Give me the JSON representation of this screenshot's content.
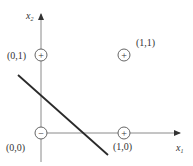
{
  "diagram": {
    "type": "linear-decision-boundary",
    "axes": {
      "x": {
        "label": "x",
        "subscript": "1"
      },
      "y": {
        "label": "x",
        "subscript": "2"
      }
    },
    "points": [
      {
        "coord_label": "(0,0)",
        "sign": "−",
        "class": "negative"
      },
      {
        "coord_label": "(0,1)",
        "sign": "+",
        "class": "positive"
      },
      {
        "coord_label": "(1,0)",
        "sign": "+",
        "class": "positive"
      },
      {
        "coord_label": "(1,1)",
        "sign": "+",
        "class": "positive"
      }
    ],
    "decision_line": {
      "description": "separating line between (0,0) and the other points"
    },
    "colors": {
      "axis": "#8a8a8a",
      "line": "#2a2a2a",
      "text": "#333333"
    }
  }
}
